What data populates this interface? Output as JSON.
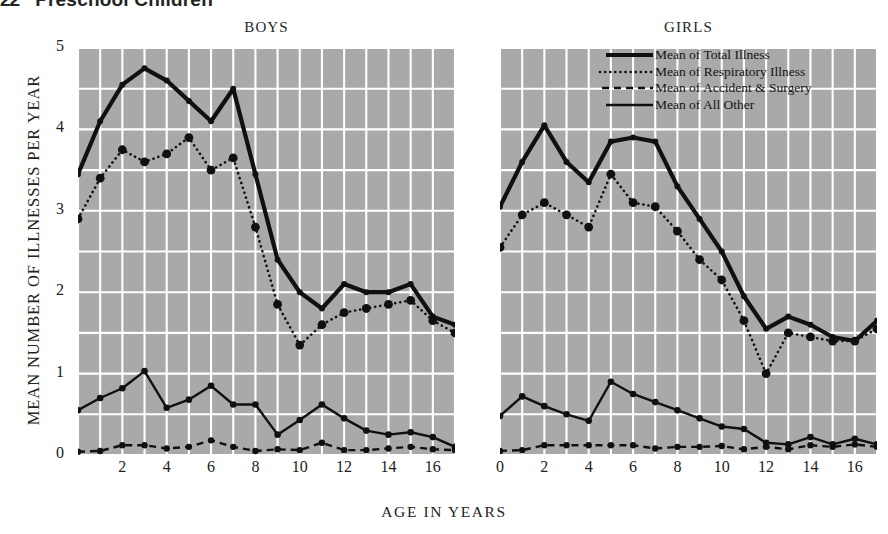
{
  "runhead": {
    "number": "22",
    "title": "Preschool Children"
  },
  "axes": {
    "y_title": "MEAN NUMBER OF ILLNESSES PER YEAR",
    "x_title": "AGE IN YEARS",
    "y_ticks": [
      "0",
      "1",
      "2",
      "3",
      "4",
      "5"
    ],
    "x_ticks_boys": [
      "2",
      "4",
      "6",
      "8",
      "10",
      "12",
      "14",
      "16"
    ],
    "x_ticks_girls": [
      "0",
      "2",
      "4",
      "6",
      "8",
      "10",
      "12",
      "14",
      "16"
    ]
  },
  "legend": {
    "items": [
      {
        "label": "Mean of Total Illness",
        "style": "solid-thick",
        "icon": "solid-thick-line-icon"
      },
      {
        "label": "Mean of Respiratory Illness",
        "style": "dotted",
        "icon": "dotted-line-icon"
      },
      {
        "label": "Mean of Accident & Surgery",
        "style": "dashed",
        "icon": "dashed-line-icon"
      },
      {
        "label": "Mean of All Other",
        "style": "solid-thin",
        "icon": "solid-thin-line-icon"
      }
    ]
  },
  "colors": {
    "plot_background": "#a9a9a9",
    "grid": "#ffffff",
    "line": "#101010",
    "page_background": "#ffffff",
    "text": "#1f1f1f"
  },
  "chart_data": {
    "type": "line",
    "xlabel": "AGE IN YEARS",
    "ylabel": "MEAN NUMBER OF ILLNESSES PER YEAR",
    "xlim": [
      0,
      17
    ],
    "ylim": [
      0,
      5
    ],
    "grid": true,
    "grid_x_step": 1,
    "grid_y_step": 0.5,
    "legend_position": "top-right",
    "x": [
      0,
      1,
      2,
      3,
      4,
      5,
      6,
      7,
      8,
      9,
      10,
      11,
      12,
      13,
      14,
      15,
      16,
      17
    ],
    "panels": [
      {
        "name": "BOYS",
        "series": [
          {
            "name": "Mean of Total Illness",
            "style": "solid-thick",
            "values": [
              3.45,
              4.1,
              4.55,
              4.75,
              4.6,
              4.35,
              4.1,
              4.5,
              3.45,
              2.4,
              2.0,
              1.8,
              2.1,
              2.0,
              2.0,
              2.1,
              1.7,
              1.6
            ]
          },
          {
            "name": "Mean of Respiratory Illness",
            "style": "dotted",
            "values": [
              2.9,
              3.4,
              3.75,
              3.6,
              3.7,
              3.9,
              3.5,
              3.65,
              2.8,
              1.85,
              1.35,
              1.6,
              1.75,
              1.8,
              1.85,
              1.9,
              1.65,
              1.5
            ]
          },
          {
            "name": "Mean of Accident & Surgery",
            "style": "dashed",
            "values": [
              0.04,
              0.05,
              0.12,
              0.12,
              0.08,
              0.1,
              0.18,
              0.1,
              0.05,
              0.07,
              0.06,
              0.15,
              0.06,
              0.06,
              0.08,
              0.1,
              0.07,
              0.06
            ]
          },
          {
            "name": "Mean of All Other",
            "style": "solid-thin",
            "values": [
              0.55,
              0.7,
              0.82,
              1.03,
              0.58,
              0.68,
              0.85,
              0.62,
              0.62,
              0.25,
              0.43,
              0.62,
              0.45,
              0.3,
              0.25,
              0.28,
              0.22,
              0.1
            ]
          }
        ]
      },
      {
        "name": "GIRLS",
        "series": [
          {
            "name": "Mean of Total Illness",
            "style": "solid-thick",
            "values": [
              3.05,
              3.6,
              4.05,
              3.6,
              3.35,
              3.85,
              3.9,
              3.85,
              3.3,
              2.9,
              2.5,
              1.95,
              1.55,
              1.7,
              1.6,
              1.45,
              1.4,
              1.65,
              1.35
            ]
          },
          {
            "name": "Mean of Respiratory Illness",
            "style": "dotted",
            "values": [
              2.55,
              2.95,
              3.1,
              2.95,
              2.8,
              3.45,
              3.1,
              3.05,
              2.75,
              2.4,
              2.15,
              1.65,
              1.0,
              1.5,
              1.45,
              1.4,
              1.4,
              1.55,
              1.3
            ]
          },
          {
            "name": "Mean of Accident & Surgery",
            "style": "dashed",
            "values": [
              0.05,
              0.06,
              0.12,
              0.12,
              0.12,
              0.12,
              0.12,
              0.08,
              0.1,
              0.1,
              0.11,
              0.07,
              0.1,
              0.07,
              0.12,
              0.1,
              0.13,
              0.1
            ]
          },
          {
            "name": "Mean of All Other",
            "style": "solid-thin",
            "values": [
              0.48,
              0.72,
              0.6,
              0.5,
              0.42,
              0.9,
              0.75,
              0.65,
              0.55,
              0.45,
              0.35,
              0.32,
              0.15,
              0.13,
              0.22,
              0.13,
              0.2,
              0.13
            ]
          }
        ]
      }
    ]
  }
}
